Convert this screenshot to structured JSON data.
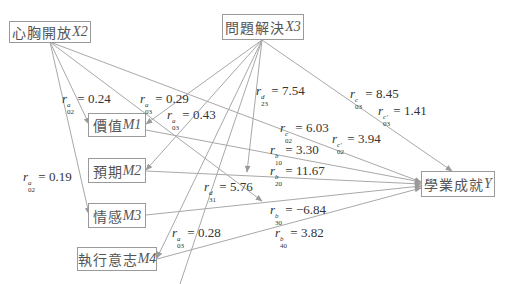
{
  "nodes": {
    "X2": {
      "name": "心胸開放",
      "var": "X2"
    },
    "X3": {
      "name": "問題解決",
      "var": "X3"
    },
    "M1": {
      "name": "價值",
      "var": "M1"
    },
    "M2": {
      "name": "預期",
      "var": "M2"
    },
    "M3": {
      "name": "情感",
      "var": "M3"
    },
    "M4": {
      "name": "執行意志",
      "var": "M4"
    },
    "Y": {
      "name": "學業成就",
      "var": "Y"
    }
  },
  "paths": [
    {
      "id": "a02_M1",
      "sup": "a",
      "sub": "02",
      "value": "= 0.24"
    },
    {
      "id": "a03_M1",
      "sup": "a",
      "sub": "03",
      "value": "= 0.29"
    },
    {
      "id": "a03_M2",
      "sup": "a",
      "sub": "03",
      "value": "= 0.43"
    },
    {
      "id": "a02_M3",
      "sup": "a",
      "sub": "02",
      "value": "= 0.19"
    },
    {
      "id": "a03_M4",
      "sup": "a",
      "sub": "03",
      "value": "= 0.28"
    },
    {
      "id": "d23",
      "sup": "d",
      "sub": "23",
      "value": "= 7.54"
    },
    {
      "id": "d31",
      "sup": "d",
      "sub": "31",
      "value": "= 5.76"
    },
    {
      "id": "c03",
      "sup": "c",
      "sub": "03",
      "value": "= 8.45"
    },
    {
      "id": "c03p",
      "sup": "c'",
      "sub": "03",
      "value": "= 1.41"
    },
    {
      "id": "c02",
      "sup": "c",
      "sub": "02",
      "value": "= 6.03"
    },
    {
      "id": "c02p",
      "sup": "c'",
      "sub": "02",
      "value": "= 3.94"
    },
    {
      "id": "b10",
      "sup": "b",
      "sub": "10",
      "value": "= 3.30"
    },
    {
      "id": "b20",
      "sup": "b",
      "sub": "20",
      "value": "= 11.67"
    },
    {
      "id": "b30",
      "sup": "b",
      "sub": "30",
      "value": "= −6.84"
    },
    {
      "id": "b40",
      "sup": "b",
      "sub": "40",
      "value": "= 3.82"
    }
  ],
  "colors": {
    "edge": "#a0a0a0",
    "border": "#9a9a9a",
    "text": "#333333"
  }
}
